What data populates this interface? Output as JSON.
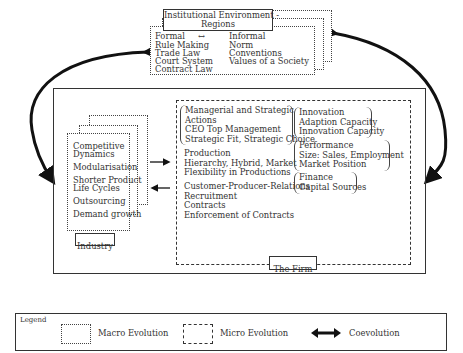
{
  "institutional": {
    "title_line1": "Institutional Environment -",
    "title_line2": "Regions",
    "formal_label": "Formal",
    "arrow": "↔",
    "informal_label": "Informal",
    "formal_items": [
      "Rule Making",
      "Trade Law",
      "Court System",
      "Contract Law"
    ],
    "informal_items": [
      "Norm",
      "Conventions",
      "Values of a Society"
    ]
  },
  "industry": {
    "label": "Industry",
    "items": [
      "Competitive Dynamics",
      "Modularisation",
      "Shorter Product Life Cycles",
      "Outsourcing",
      "Demand growth"
    ],
    "lines": [
      "Competitive",
      "Dynamics",
      "Modularisation",
      "Shorter Product",
      "Life Cycles",
      "Outsourcing",
      "Demand growth"
    ]
  },
  "firm": {
    "label": "The Firm",
    "managerial": [
      "Managerial and Strategic",
      "Actions",
      "CEO Top Management",
      "Strategic Fit, Strategic Choice"
    ],
    "production": [
      "Production",
      "Hierarchy, Hybrid, Market",
      "Flexibility in Productions"
    ],
    "relations": [
      "Customer-Producer-Relations",
      "Recruitment",
      "Contracts",
      "Enforcement of Contracts"
    ],
    "innovation": [
      "Innovation",
      "Adaption Capacity",
      "Innovation Capacity"
    ],
    "performance": [
      "Performance",
      "Size: Sales, Employment",
      "Market Position"
    ],
    "finance": [
      "Finance",
      "Capital Sources"
    ]
  },
  "legend": {
    "title": "Legend",
    "macro": "Macro Evolution",
    "micro": "Micro Evolution",
    "coevolution": "Coevolution"
  }
}
